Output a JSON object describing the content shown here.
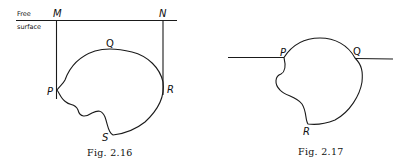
{
  "figures": [
    {
      "caption": "Fig. 2.16",
      "labels": {
        "surface_line1": "Free",
        "surface_line2": "surface",
        "M": "M",
        "N": "N",
        "Q": "Q",
        "P": "P",
        "R": "R",
        "S": "S"
      }
    },
    {
      "caption": "Fig. 2.17",
      "labels": {
        "P": "P",
        "Q": "Q",
        "R": "R"
      }
    }
  ]
}
